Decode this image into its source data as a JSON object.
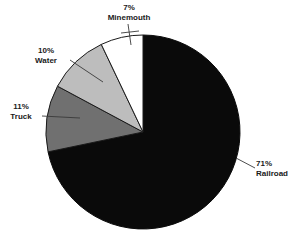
{
  "chart_data": {
    "type": "pie",
    "title": "",
    "subtitle": "",
    "xlabel": "",
    "ylabel": "",
    "legend_position": "none",
    "grid": false,
    "units": "percent",
    "start_angle_deg": 0,
    "direction": "clockwise",
    "categories": [
      "Railroad",
      "Truck",
      "Water",
      "Minemouth"
    ],
    "values": [
      71,
      11,
      10,
      7
    ],
    "slices": [
      {
        "name": "Railroad",
        "label_percent": "71%",
        "label_name": "Railroad",
        "value": 71,
        "color": "#0a0a0a",
        "stroke": "#0a0a0a"
      },
      {
        "name": "Truck",
        "label_percent": "11%",
        "label_name": "Truck",
        "value": 11,
        "color": "#707070",
        "stroke": "#1a1a1a"
      },
      {
        "name": "Water",
        "label_percent": "10%",
        "label_name": "Water",
        "value": 10,
        "color": "#bdbdbd",
        "stroke": "#1a1a1a"
      },
      {
        "name": "Minemouth",
        "label_percent": "7%",
        "label_name": "Minemouth",
        "value": 7,
        "color": "#ffffff",
        "stroke": "#1a1a1a"
      }
    ]
  },
  "colors": {
    "background": "#ffffff",
    "text": "#1a1a1a",
    "leader_line": "#3a3a3a",
    "railroad": "#0a0a0a",
    "truck": "#707070",
    "water": "#bdbdbd",
    "minemouth": "#ffffff"
  },
  "labels": {
    "minemouth": {
      "percent": "7%",
      "name": "Minemouth"
    },
    "water": {
      "percent": "10%",
      "name": "Water"
    },
    "truck": {
      "percent": "11%",
      "name": "Truck"
    },
    "railroad": {
      "percent": "71%",
      "name": "Railroad"
    }
  }
}
